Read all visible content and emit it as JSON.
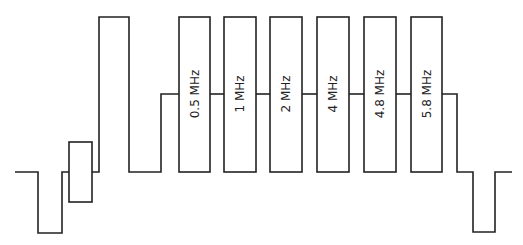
{
  "diagram": {
    "type": "multiburst-test-signal-waveform",
    "line_color": "#222222",
    "background": "#ffffff",
    "bursts": [
      {
        "label": "0.5 MHz",
        "x": 179,
        "w": 31
      },
      {
        "label": "1 MHz",
        "x": 224,
        "w": 32
      },
      {
        "label": "2 MHz",
        "x": 270,
        "w": 32
      },
      {
        "label": "4 MHz",
        "x": 317,
        "w": 32
      },
      {
        "label": "4.8 MHz",
        "x": 364,
        "w": 32
      },
      {
        "label": "5.8 MHz",
        "x": 411,
        "w": 31
      }
    ],
    "levels": {
      "top": 17,
      "mid": 94,
      "blank": 172,
      "sync": 233
    },
    "color_burst": {
      "x": 69,
      "w": 23,
      "top": 142,
      "bottom": 202
    },
    "white_bar": {
      "x1": 99,
      "x2": 129
    }
  }
}
